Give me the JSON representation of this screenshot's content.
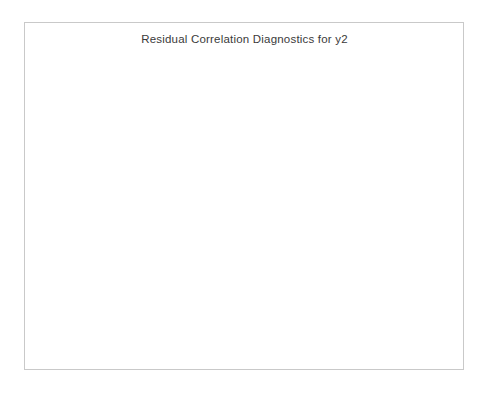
{
  "figure": {
    "title": "Residual Correlation Diagnostics for y2",
    "background_color": "#ffffff",
    "frame_color": "#c9c9c9",
    "bar_color": "#4d4d4d",
    "band_color": "#b9b9b9"
  },
  "chart_data": [
    {
      "type": "bar",
      "name": "acf-panel",
      "title": "",
      "xlabel": "Lag",
      "ylabel": "ACF",
      "xlim": [
        -1.5,
        26.5
      ],
      "ylim": [
        -1.15,
        1.15
      ],
      "xticks": [
        0,
        5,
        10,
        15,
        20,
        25
      ],
      "xticklabels": [
        "0",
        "5",
        "10",
        "15",
        "20",
        "25"
      ],
      "yticks": [
        1.0,
        0.5,
        0.0,
        -0.5,
        -1.0
      ],
      "yticklabels": [
        "1.0",
        "0.5",
        "0.0",
        "-0.5",
        "-1.0"
      ],
      "grid": false,
      "legend": "none",
      "confidence_band": 0.062,
      "x": [
        0,
        1,
        2,
        3,
        4,
        5,
        6,
        7,
        8,
        9,
        10,
        11,
        12,
        13,
        14,
        15,
        16,
        17,
        18,
        19,
        20,
        21,
        22,
        23,
        24
      ],
      "values": [
        1.0,
        -0.021,
        -0.015,
        -0.008,
        0.006,
        0.018,
        -0.004,
        0.013,
        -0.01,
        -0.005,
        0.009,
        0.027,
        0.004,
        -0.012,
        0.011,
        -0.018,
        -0.006,
        -0.022,
        0.005,
        -0.009,
        0.012,
        -0.003,
        0.008,
        0.002,
        0.026
      ]
    },
    {
      "type": "bar",
      "name": "pacf-panel",
      "title": "",
      "xlabel": "Lag",
      "ylabel": "PACF",
      "xlim": [
        -1.5,
        26.5
      ],
      "ylim": [
        -1.15,
        1.15
      ],
      "xticks": [
        0,
        5,
        10,
        15,
        20,
        25
      ],
      "xticklabels": [
        "0",
        "5",
        "10",
        "15",
        "20",
        "25"
      ],
      "yticks": [
        1.0,
        0.5,
        0.0,
        -0.5,
        -1.0
      ],
      "yticklabels": [
        "1.0",
        "0.5",
        "0.0",
        "-0.5",
        "-1.0"
      ],
      "grid": false,
      "legend": "none",
      "confidence_band": 0.062,
      "x": [
        1,
        2,
        3,
        4,
        5,
        6,
        7,
        8,
        9,
        10,
        11,
        12,
        13,
        14,
        15,
        16,
        17,
        18,
        19,
        20,
        21,
        22,
        23,
        24
      ],
      "values": [
        -0.02,
        -0.016,
        -0.007,
        -0.024,
        0.02,
        -0.006,
        0.016,
        -0.009,
        -0.004,
        0.008,
        0.03,
        0.003,
        0.012,
        -0.008,
        -0.014,
        -0.02,
        -0.025,
        -0.013,
        -0.017,
        -0.028,
        -0.022,
        -0.011,
        -0.006,
        0.025
      ]
    },
    {
      "type": "bar",
      "name": "iacf-panel",
      "title": "",
      "xlabel": "Lag",
      "ylabel": "IACF",
      "xlim": [
        -1.5,
        26.5
      ],
      "ylim": [
        -1.15,
        1.15
      ],
      "xticks": [
        0,
        5,
        10,
        15,
        20,
        25
      ],
      "xticklabels": [
        "0",
        "5",
        "10",
        "15",
        "20",
        "25"
      ],
      "yticks": [
        1.0,
        0.5,
        0.0,
        -0.5,
        -1.0
      ],
      "yticklabels": [
        "1.0",
        "0.5",
        "0.0",
        "-0.5",
        "-1.0"
      ],
      "grid": false,
      "legend": "none",
      "confidence_band": 0.062,
      "x": [
        0,
        1,
        2,
        3,
        4,
        5,
        6,
        7,
        8,
        9,
        10,
        11,
        12,
        13,
        14,
        15,
        16,
        17,
        18,
        19,
        20,
        21,
        22,
        23,
        24
      ],
      "values": [
        1.0,
        -0.028,
        -0.02,
        -0.012,
        -0.03,
        -0.022,
        -0.014,
        -0.026,
        -0.01,
        -0.018,
        -0.012,
        -0.008,
        -0.02,
        -0.006,
        0.01,
        0.022,
        0.016,
        0.026,
        0.03,
        0.028,
        0.032,
        0.024,
        0.006,
        -0.024,
        -0.03
      ]
    },
    {
      "type": "bar",
      "name": "white-noise-panel",
      "title": "",
      "xlabel": "Lag",
      "ylabel": "White Noise Prob",
      "xlim": [
        -1.5,
        26.5
      ],
      "yscale": "reverse-log-prob",
      "yticks": [
        0.001,
        0.05,
        1.0
      ],
      "yticklabels": [
        ".001",
        ".05",
        "1.0"
      ],
      "extra_gridlines": [
        0.01
      ],
      "grid": true,
      "legend": "none",
      "shaded_region_x": [
        -1.5,
        2.0
      ],
      "x": [
        3,
        4,
        5,
        6,
        7,
        8,
        9,
        10,
        11,
        12,
        13,
        14,
        15,
        16,
        17,
        18,
        19,
        20,
        21,
        22,
        23,
        24
      ],
      "values": [
        0.93,
        0.93,
        0.88,
        0.92,
        0.95,
        0.97,
        0.98,
        0.985,
        0.985,
        0.99,
        0.99,
        0.99,
        0.99,
        0.99,
        0.99,
        0.985,
        0.985,
        0.985,
        0.985,
        0.985,
        0.985,
        0.985
      ]
    }
  ]
}
